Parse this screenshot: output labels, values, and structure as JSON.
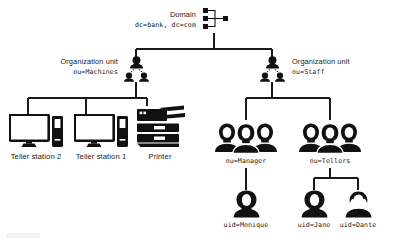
{
  "diagram": {
    "type": "tree",
    "stroke_color": "#1a1a1a",
    "fill_color": "#111111",
    "background": "#ffffff"
  },
  "nodes": {
    "domain": {
      "icon": "network-tree-icon",
      "title": "Domain",
      "dn": "dc=bank, dc=com",
      "x": 218,
      "y": 20
    },
    "ou_machines": {
      "icon": "user-group-icon",
      "title": "Organization unit",
      "dn": "ou=Machines",
      "x": 110,
      "y": 66
    },
    "ou_staff": {
      "icon": "user-group-icon",
      "title": "Organization unit",
      "dn": "ou=Staff",
      "x": 273,
      "y": 66
    },
    "teller_station_2": {
      "icon": "desktop-computer-icon",
      "label": "Teller station 2",
      "x": 36,
      "y": 132
    },
    "teller_station_1": {
      "icon": "desktop-computer-icon",
      "label": "Teller station 1",
      "x": 101,
      "y": 132
    },
    "printer": {
      "icon": "printer-icon",
      "label": "Printer",
      "x": 160,
      "y": 131
    },
    "ou_manager": {
      "icon": "people-group-icon",
      "label": "ou=Manager",
      "x": 246,
      "y": 132
    },
    "ou_tellers": {
      "icon": "people-group-icon",
      "label": "ou=Tellers",
      "x": 330,
      "y": 132
    },
    "uid_monique": {
      "icon": "person-female-icon",
      "label": "uid=Monique",
      "x": 246,
      "y": 198
    },
    "uid_jane": {
      "icon": "person-female-icon",
      "label": "uid=Jane",
      "x": 314,
      "y": 198
    },
    "uid_dante": {
      "icon": "person-male-icon",
      "label": "uid=Dante",
      "x": 358,
      "y": 198
    }
  },
  "edges": [
    {
      "from": "domain",
      "to": "ou_machines"
    },
    {
      "from": "domain",
      "to": "ou_staff"
    },
    {
      "from": "ou_machines",
      "to": "teller_station_2"
    },
    {
      "from": "ou_machines",
      "to": "teller_station_1"
    },
    {
      "from": "ou_machines",
      "to": "printer"
    },
    {
      "from": "ou_staff",
      "to": "ou_manager"
    },
    {
      "from": "ou_staff",
      "to": "ou_tellers"
    },
    {
      "from": "ou_manager",
      "to": "uid_monique"
    },
    {
      "from": "ou_tellers",
      "to": "uid_jane"
    },
    {
      "from": "ou_tellers",
      "to": "uid_dante"
    }
  ]
}
